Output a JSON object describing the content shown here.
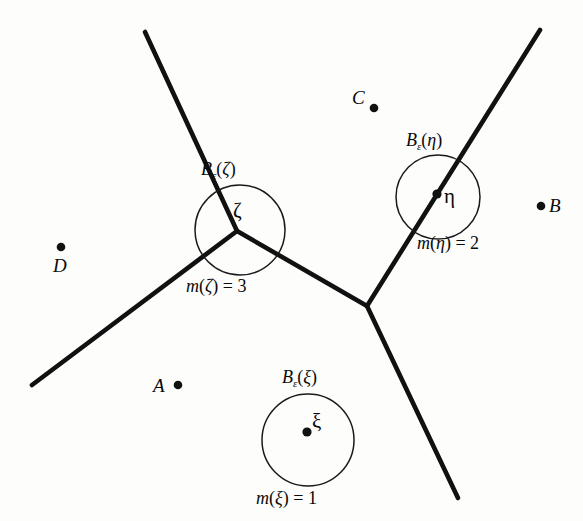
{
  "figure": {
    "background_color": "#fdfdfc",
    "line_color": "#111111",
    "circle_color": "#1a1a1a",
    "dot_color": "#111111",
    "width": 583,
    "height": 521
  },
  "balls": [
    {
      "id": "zeta",
      "label_prefix": "B",
      "label_sub": "ε",
      "label_open": "(",
      "label_arg": "ζ",
      "label_close": ")",
      "label_full": "Bε(ζ)",
      "point_label": "ζ",
      "mult_m": "m",
      "mult_open": "(",
      "mult_arg": "ζ",
      "mult_close": ")",
      "mult_eq": " = ",
      "mult_value": "3",
      "mult_full": "m(ζ) = 3",
      "center_x": 240,
      "center_y": 230,
      "radius": 45
    },
    {
      "id": "eta",
      "label_prefix": "B",
      "label_sub": "ε",
      "label_open": "(",
      "label_arg": "η",
      "label_close": ")",
      "label_full": "Bε(η)",
      "point_label": "η",
      "mult_m": "m",
      "mult_open": "(",
      "mult_arg": "η",
      "mult_close": ")",
      "mult_eq": " = ",
      "mult_value": "2",
      "mult_full": "m(η) = 2",
      "center_x": 438,
      "center_y": 197,
      "radius": 42
    },
    {
      "id": "xi",
      "label_prefix": "B",
      "label_sub": "ε",
      "label_open": "(",
      "label_arg": "ξ",
      "label_close": ")",
      "label_full": "Bε(ξ)",
      "point_label": "ξ",
      "mult_m": "m",
      "mult_open": "(",
      "mult_arg": "ξ",
      "mult_close": ")",
      "mult_eq": " = ",
      "mult_value": "1",
      "mult_full": "m(ξ) = 1",
      "center_x": 308,
      "center_y": 440,
      "radius": 46
    }
  ],
  "points": [
    {
      "id": "A",
      "label": "A",
      "label_side": "left",
      "dot_x": 178,
      "dot_y": 385
    },
    {
      "id": "B",
      "label": "B",
      "label_side": "right",
      "dot_x": 541,
      "dot_y": 206
    },
    {
      "id": "C",
      "label": "C",
      "label_side": "upper-left",
      "dot_x": 374,
      "dot_y": 108
    },
    {
      "id": "D",
      "label": "D",
      "label_side": "below",
      "dot_x": 61,
      "dot_y": 247
    }
  ],
  "vertices": [
    {
      "id": "zeta-vertex",
      "x": 237,
      "y": 231,
      "valence": 3
    },
    {
      "id": "center-vertex",
      "x": 367,
      "y": 306,
      "valence": 3
    }
  ],
  "edges": [
    {
      "id": "edge-zeta-upper-left",
      "from": [
        145,
        32
      ],
      "to": [
        237,
        231
      ]
    },
    {
      "id": "edge-zeta-lower-left",
      "from": [
        237,
        231
      ],
      "to": [
        32,
        385
      ]
    },
    {
      "id": "edge-zeta-to-center",
      "from": [
        237,
        231
      ],
      "to": [
        367,
        306
      ]
    },
    {
      "id": "edge-center-upper-right",
      "from": [
        367,
        306
      ],
      "to": [
        540,
        30
      ]
    },
    {
      "id": "edge-center-lower-right",
      "from": [
        367,
        306
      ],
      "to": [
        458,
        498
      ]
    }
  ]
}
